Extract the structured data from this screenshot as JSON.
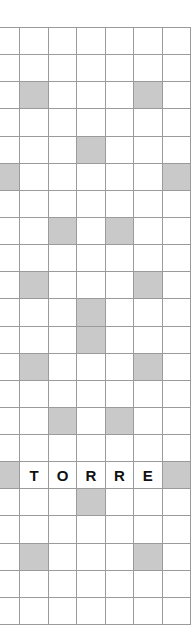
{
  "puzzle": {
    "name": "crossword-grid",
    "columns": 7,
    "rows": 22,
    "colors": {
      "background": "#ffffff",
      "cell_fill": "#ffffff",
      "blocked_fill": "#c9c9c9",
      "grid_line": "#9b9b9b",
      "letter_color": "#111111"
    },
    "answer_word": "TORRE",
    "answer_row_index": 16,
    "answer_start_column_index": 1,
    "cells": [
      [
        {
          "state": "open",
          "letter": ""
        },
        {
          "state": "open",
          "letter": ""
        },
        {
          "state": "open",
          "letter": ""
        },
        {
          "state": "open",
          "letter": ""
        },
        {
          "state": "open",
          "letter": ""
        },
        {
          "state": "open",
          "letter": ""
        },
        {
          "state": "open",
          "letter": ""
        }
      ],
      [
        {
          "state": "open",
          "letter": ""
        },
        {
          "state": "open",
          "letter": ""
        },
        {
          "state": "open",
          "letter": ""
        },
        {
          "state": "open",
          "letter": ""
        },
        {
          "state": "open",
          "letter": ""
        },
        {
          "state": "open",
          "letter": ""
        },
        {
          "state": "open",
          "letter": ""
        }
      ],
      [
        {
          "state": "open",
          "letter": ""
        },
        {
          "state": "blocked",
          "letter": ""
        },
        {
          "state": "open",
          "letter": ""
        },
        {
          "state": "open",
          "letter": ""
        },
        {
          "state": "open",
          "letter": ""
        },
        {
          "state": "blocked",
          "letter": ""
        },
        {
          "state": "open",
          "letter": ""
        }
      ],
      [
        {
          "state": "open",
          "letter": ""
        },
        {
          "state": "open",
          "letter": ""
        },
        {
          "state": "open",
          "letter": ""
        },
        {
          "state": "open",
          "letter": ""
        },
        {
          "state": "open",
          "letter": ""
        },
        {
          "state": "open",
          "letter": ""
        },
        {
          "state": "open",
          "letter": ""
        }
      ],
      [
        {
          "state": "open",
          "letter": ""
        },
        {
          "state": "open",
          "letter": ""
        },
        {
          "state": "open",
          "letter": ""
        },
        {
          "state": "blocked",
          "letter": ""
        },
        {
          "state": "open",
          "letter": ""
        },
        {
          "state": "open",
          "letter": ""
        },
        {
          "state": "open",
          "letter": ""
        }
      ],
      [
        {
          "state": "blocked",
          "letter": ""
        },
        {
          "state": "open",
          "letter": ""
        },
        {
          "state": "open",
          "letter": ""
        },
        {
          "state": "open",
          "letter": ""
        },
        {
          "state": "open",
          "letter": ""
        },
        {
          "state": "open",
          "letter": ""
        },
        {
          "state": "blocked",
          "letter": ""
        }
      ],
      [
        {
          "state": "open",
          "letter": ""
        },
        {
          "state": "open",
          "letter": ""
        },
        {
          "state": "open",
          "letter": ""
        },
        {
          "state": "open",
          "letter": ""
        },
        {
          "state": "open",
          "letter": ""
        },
        {
          "state": "open",
          "letter": ""
        },
        {
          "state": "open",
          "letter": ""
        }
      ],
      [
        {
          "state": "open",
          "letter": ""
        },
        {
          "state": "open",
          "letter": ""
        },
        {
          "state": "blocked",
          "letter": ""
        },
        {
          "state": "open",
          "letter": ""
        },
        {
          "state": "blocked",
          "letter": ""
        },
        {
          "state": "open",
          "letter": ""
        },
        {
          "state": "open",
          "letter": ""
        }
      ],
      [
        {
          "state": "open",
          "letter": ""
        },
        {
          "state": "open",
          "letter": ""
        },
        {
          "state": "open",
          "letter": ""
        },
        {
          "state": "open",
          "letter": ""
        },
        {
          "state": "open",
          "letter": ""
        },
        {
          "state": "open",
          "letter": ""
        },
        {
          "state": "open",
          "letter": ""
        }
      ],
      [
        {
          "state": "open",
          "letter": ""
        },
        {
          "state": "blocked",
          "letter": ""
        },
        {
          "state": "open",
          "letter": ""
        },
        {
          "state": "open",
          "letter": ""
        },
        {
          "state": "open",
          "letter": ""
        },
        {
          "state": "blocked",
          "letter": ""
        },
        {
          "state": "open",
          "letter": ""
        }
      ],
      [
        {
          "state": "open",
          "letter": ""
        },
        {
          "state": "open",
          "letter": ""
        },
        {
          "state": "open",
          "letter": ""
        },
        {
          "state": "blocked",
          "letter": ""
        },
        {
          "state": "open",
          "letter": ""
        },
        {
          "state": "open",
          "letter": ""
        },
        {
          "state": "open",
          "letter": ""
        }
      ],
      [
        {
          "state": "open",
          "letter": ""
        },
        {
          "state": "open",
          "letter": ""
        },
        {
          "state": "open",
          "letter": ""
        },
        {
          "state": "blocked",
          "letter": ""
        },
        {
          "state": "open",
          "letter": ""
        },
        {
          "state": "open",
          "letter": ""
        },
        {
          "state": "open",
          "letter": ""
        }
      ],
      [
        {
          "state": "open",
          "letter": ""
        },
        {
          "state": "blocked",
          "letter": ""
        },
        {
          "state": "open",
          "letter": ""
        },
        {
          "state": "open",
          "letter": ""
        },
        {
          "state": "open",
          "letter": ""
        },
        {
          "state": "blocked",
          "letter": ""
        },
        {
          "state": "open",
          "letter": ""
        }
      ],
      [
        {
          "state": "open",
          "letter": ""
        },
        {
          "state": "open",
          "letter": ""
        },
        {
          "state": "open",
          "letter": ""
        },
        {
          "state": "open",
          "letter": ""
        },
        {
          "state": "open",
          "letter": ""
        },
        {
          "state": "open",
          "letter": ""
        },
        {
          "state": "open",
          "letter": ""
        }
      ],
      [
        {
          "state": "open",
          "letter": ""
        },
        {
          "state": "open",
          "letter": ""
        },
        {
          "state": "blocked",
          "letter": ""
        },
        {
          "state": "open",
          "letter": ""
        },
        {
          "state": "blocked",
          "letter": ""
        },
        {
          "state": "open",
          "letter": ""
        },
        {
          "state": "open",
          "letter": ""
        }
      ],
      [
        {
          "state": "open",
          "letter": ""
        },
        {
          "state": "open",
          "letter": ""
        },
        {
          "state": "open",
          "letter": ""
        },
        {
          "state": "open",
          "letter": ""
        },
        {
          "state": "open",
          "letter": ""
        },
        {
          "state": "open",
          "letter": ""
        },
        {
          "state": "open",
          "letter": ""
        }
      ],
      [
        {
          "state": "blocked",
          "letter": ""
        },
        {
          "state": "open",
          "letter": "T"
        },
        {
          "state": "open",
          "letter": "O"
        },
        {
          "state": "open",
          "letter": "R"
        },
        {
          "state": "open",
          "letter": "R"
        },
        {
          "state": "open",
          "letter": "E"
        },
        {
          "state": "blocked",
          "letter": ""
        }
      ],
      [
        {
          "state": "open",
          "letter": ""
        },
        {
          "state": "open",
          "letter": ""
        },
        {
          "state": "open",
          "letter": ""
        },
        {
          "state": "blocked",
          "letter": ""
        },
        {
          "state": "open",
          "letter": ""
        },
        {
          "state": "open",
          "letter": ""
        },
        {
          "state": "open",
          "letter": ""
        }
      ],
      [
        {
          "state": "open",
          "letter": ""
        },
        {
          "state": "open",
          "letter": ""
        },
        {
          "state": "open",
          "letter": ""
        },
        {
          "state": "open",
          "letter": ""
        },
        {
          "state": "open",
          "letter": ""
        },
        {
          "state": "open",
          "letter": ""
        },
        {
          "state": "open",
          "letter": ""
        }
      ],
      [
        {
          "state": "open",
          "letter": ""
        },
        {
          "state": "blocked",
          "letter": ""
        },
        {
          "state": "open",
          "letter": ""
        },
        {
          "state": "open",
          "letter": ""
        },
        {
          "state": "open",
          "letter": ""
        },
        {
          "state": "blocked",
          "letter": ""
        },
        {
          "state": "open",
          "letter": ""
        }
      ],
      [
        {
          "state": "open",
          "letter": ""
        },
        {
          "state": "open",
          "letter": ""
        },
        {
          "state": "open",
          "letter": ""
        },
        {
          "state": "open",
          "letter": ""
        },
        {
          "state": "open",
          "letter": ""
        },
        {
          "state": "open",
          "letter": ""
        },
        {
          "state": "open",
          "letter": ""
        }
      ],
      [
        {
          "state": "open",
          "letter": ""
        },
        {
          "state": "open",
          "letter": ""
        },
        {
          "state": "open",
          "letter": ""
        },
        {
          "state": "open",
          "letter": ""
        },
        {
          "state": "open",
          "letter": ""
        },
        {
          "state": "open",
          "letter": ""
        },
        {
          "state": "open",
          "letter": ""
        }
      ]
    ]
  }
}
